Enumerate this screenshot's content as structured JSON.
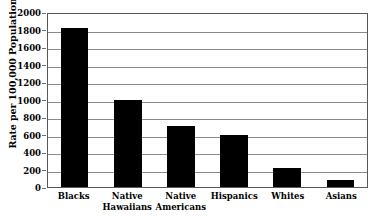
{
  "chart_data": {
    "type": "bar",
    "title": "",
    "title_cropped_fragment": "",
    "xlabel": "",
    "ylabel": "Rate per 100,000 Population",
    "categories": [
      "Blacks",
      "Native Hawaiians",
      "Native Americans",
      "Hispanics",
      "Whites",
      "Asians"
    ],
    "category_lines": [
      [
        "Blacks"
      ],
      [
        "Native",
        "Hawaiians"
      ],
      [
        "Native",
        "Americans"
      ],
      [
        "Hispanics"
      ],
      [
        "Whites"
      ],
      [
        "Asians"
      ]
    ],
    "values": [
      1820,
      1000,
      700,
      600,
      220,
      80
    ],
    "ylim": [
      0,
      2000
    ],
    "yticks": [
      2000,
      1800,
      1600,
      1400,
      1200,
      1000,
      800,
      600,
      400,
      200,
      0
    ],
    "ytick_labels": [
      "2000",
      "1800",
      "1600",
      "1400",
      "1200",
      "1000",
      "800",
      "600",
      "400",
      "200",
      "0"
    ],
    "grid": true,
    "grid_axis": "y",
    "legend": false,
    "bar_color": "#000000",
    "grid_color": "#8a8a8a",
    "axis_color": "#585858",
    "background_color": "#ffffff"
  }
}
